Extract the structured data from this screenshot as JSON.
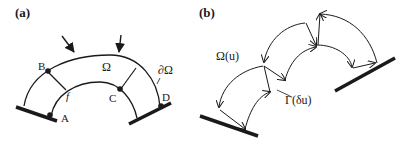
{
  "panels": [
    {
      "id": "a",
      "label": "(a)",
      "region_label": "Ω",
      "boundary_label": "∂Ω",
      "fiber_label": "f",
      "points": [
        "A",
        "B",
        "C",
        "D"
      ]
    },
    {
      "id": "b",
      "label": "(b)",
      "region_label": "Ω(u)",
      "boundary_label": "Γ(δu)"
    }
  ],
  "colors": {
    "stroke": "#1a1a1a",
    "background": "#ffffff"
  }
}
